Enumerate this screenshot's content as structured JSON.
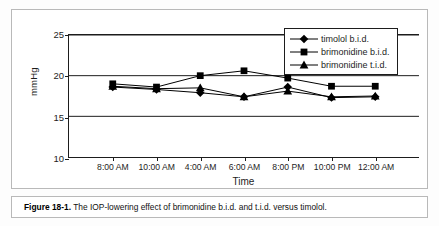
{
  "figure": {
    "caption_label": "Figure 18-1.",
    "caption_text": "The IOP-lowering effect of brimonidine b.i.d. and t.i.d. versus timolol."
  },
  "chart_data": {
    "type": "line",
    "title": "",
    "subtitle": "",
    "xlabel": "Time",
    "ylabel": "mmHg",
    "categories": [
      "8:00 AM",
      "10:00 AM",
      "4:00 AM",
      "6:00 AM",
      "8:00 PM",
      "10:00 PM",
      "12:00 AM"
    ],
    "ylim": [
      10,
      25
    ],
    "yticks": [
      10,
      15,
      20,
      25
    ],
    "grid": "horizontal",
    "legend_position": "top-right-inside",
    "series": [
      {
        "name": "timolol b.i.d.",
        "marker": "diamond",
        "color": "#000000",
        "values": [
          18.6,
          18.3,
          17.9,
          17.4,
          18.6,
          17.3,
          17.4
        ]
      },
      {
        "name": "brimonidine b.i.d.",
        "marker": "square",
        "color": "#000000",
        "values": [
          19.0,
          18.6,
          20.0,
          20.6,
          19.7,
          18.7,
          18.7
        ]
      },
      {
        "name": "brimonidine t.i.d.",
        "marker": "triangle",
        "color": "#000000",
        "values": [
          18.7,
          18.4,
          18.5,
          17.4,
          18.1,
          17.4,
          17.5
        ]
      }
    ]
  }
}
